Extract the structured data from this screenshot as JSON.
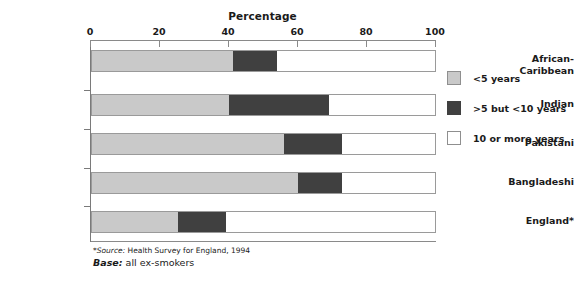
{
  "chart_data": {
    "type": "bar",
    "orientation": "horizontal",
    "stacked": true,
    "title": "Percentage",
    "xlabel": "Percentage",
    "ylabel": "",
    "xlim": [
      0,
      100
    ],
    "xticks": [
      0,
      20,
      40,
      60,
      80,
      100
    ],
    "xticklabels": [
      "0",
      "20",
      "40",
      "60",
      "80",
      "100"
    ],
    "grid": false,
    "legend_position": "right",
    "categories": [
      "African-Caribbean",
      "Indian",
      "Pakistani",
      "Bangladeshi",
      "England*"
    ],
    "series": [
      {
        "name": "<5 years",
        "color": "#c9c9c9",
        "values": [
          41,
          40,
          56,
          60,
          25
        ]
      },
      {
        "name": ">5 but <10 years",
        "color": "#404040",
        "values": [
          13,
          29,
          17,
          13,
          14
        ]
      },
      {
        "name": "10 or more years",
        "color": "#ffffff",
        "values": [
          46,
          31,
          27,
          27,
          61
        ]
      }
    ],
    "cumulative_endpoints": [
      {
        "category": "African-Caribbean",
        "seg1_end": 41,
        "seg2_end": 54
      },
      {
        "category": "Indian",
        "seg1_end": 40,
        "seg2_end": 69
      },
      {
        "category": "Pakistani",
        "seg1_end": 56,
        "seg2_end": 73
      },
      {
        "category": "Bangladeshi",
        "seg1_end": 60,
        "seg2_end": 73
      },
      {
        "category": "England*",
        "seg1_end": 25,
        "seg2_end": 39
      }
    ],
    "annotations": [
      "*Source: Health Survey for England, 1994",
      "Base: all ex-smokers"
    ]
  },
  "axis": {
    "title": "Percentage",
    "ticks": [
      {
        "label": "0",
        "value": 0
      },
      {
        "label": "20",
        "value": 20
      },
      {
        "label": "40",
        "value": 40
      },
      {
        "label": "60",
        "value": 60
      },
      {
        "label": "80",
        "value": 80
      },
      {
        "label": "100",
        "value": 100
      }
    ]
  },
  "rows": [
    {
      "label_line1": "African-",
      "label_line2": "Caribbean",
      "segments": [
        41,
        13,
        46
      ]
    },
    {
      "label_line1": "Indian",
      "label_line2": "",
      "segments": [
        40,
        29,
        31
      ]
    },
    {
      "label_line1": "Pakistani",
      "label_line2": "",
      "segments": [
        56,
        17,
        27
      ]
    },
    {
      "label_line1": "Bangladeshi",
      "label_line2": "",
      "segments": [
        60,
        13,
        27
      ]
    },
    {
      "label_line1": "England*",
      "label_line2": "",
      "segments": [
        25,
        14,
        61
      ]
    }
  ],
  "legend": {
    "items": [
      {
        "label": "<5 years",
        "color": "#c9c9c9"
      },
      {
        "label": ">5 but <10 years",
        "color": "#404040"
      },
      {
        "label": "10 or more years",
        "color": "#ffffff"
      }
    ]
  },
  "footnote": {
    "source_marker": "*",
    "source_italic": "Source:",
    "source_text": " Health Survey for England, 1994",
    "base_italic": "Base:",
    "base_text": " all ex-smokers"
  },
  "colors": {
    "series_light": "#c9c9c9",
    "series_dark": "#404040",
    "series_white": "#ffffff",
    "axis": "#8a8a8a",
    "text": "#1a1a1a"
  }
}
